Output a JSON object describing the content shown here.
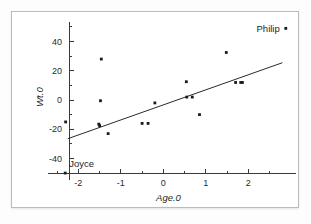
{
  "figure": {
    "background_color": "#ffffff",
    "frame_color": "#b9bcbd",
    "ink_color": "#1a1a1a"
  },
  "chart_data": {
    "type": "scatter",
    "title": "",
    "subtitle": "",
    "xlabel": "Age.0",
    "ylabel": "Wt.0",
    "xlim": [
      -2.55,
      3.05
    ],
    "ylim": [
      -52,
      52
    ],
    "xticks": [
      -2,
      -1,
      0,
      1,
      2
    ],
    "xtick_labels": [
      "-2",
      "-1",
      "0",
      "1",
      "2"
    ],
    "yticks": [
      -40,
      -20,
      0,
      20,
      40
    ],
    "ytick_labels": [
      "-40",
      "-20",
      "0",
      "20",
      "40"
    ],
    "x_minor_ticks": [
      -2.5,
      -1.5,
      -0.5,
      0.5,
      1.5,
      2.5
    ],
    "y_minor_ticks": [
      -50,
      -30,
      -10,
      10,
      30,
      50
    ],
    "grid": false,
    "legend": false,
    "legend_position": "none",
    "marker": "filled-square",
    "points": [
      {
        "x": -2.3,
        "y": -15.0
      },
      {
        "x": -2.31,
        "y": -50.0,
        "label": "Joyce",
        "label_position": "above-right"
      },
      {
        "x": -1.52,
        "y": -16.5
      },
      {
        "x": -1.5,
        "y": -17.5
      },
      {
        "x": -1.48,
        "y": -0.5
      },
      {
        "x": -1.46,
        "y": 28.0
      },
      {
        "x": -1.3,
        "y": -23.0
      },
      {
        "x": -0.5,
        "y": -16.0
      },
      {
        "x": -0.36,
        "y": -16.0
      },
      {
        "x": -0.2,
        "y": -2.0
      },
      {
        "x": 0.54,
        "y": 12.5
      },
      {
        "x": 0.55,
        "y": 2.0
      },
      {
        "x": 0.68,
        "y": 2.0
      },
      {
        "x": 0.85,
        "y": -10.0
      },
      {
        "x": 1.48,
        "y": 32.5
      },
      {
        "x": 1.7,
        "y": 12.0
      },
      {
        "x": 1.82,
        "y": 12.0
      },
      {
        "x": 1.86,
        "y": 12.0
      },
      {
        "x": 2.88,
        "y": 49.0,
        "label": "Philip",
        "label_position": "left"
      }
    ],
    "fit_line": {
      "type": "linear-regression",
      "x_start": -2.25,
      "y_start": -26.5,
      "x_end": 2.8,
      "y_end": 25.5
    },
    "annotations": [
      {
        "text": "Philip",
        "x": 2.88,
        "y": 49.0
      },
      {
        "text": "Joyce",
        "x": -2.31,
        "y": -50.0
      }
    ]
  }
}
